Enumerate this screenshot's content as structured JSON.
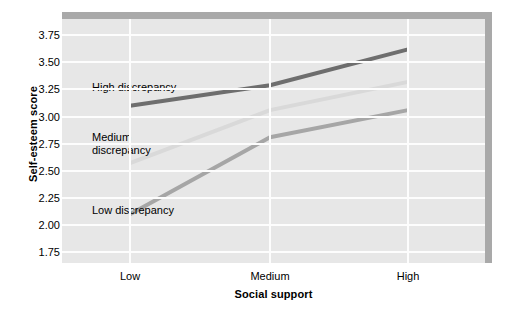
{
  "chart_data": {
    "type": "line",
    "title": "",
    "xlabel": "Social support",
    "ylabel": "Self-esteem score",
    "categories": [
      "Low",
      "Medium",
      "High"
    ],
    "ylim": [
      1.65,
      3.9
    ],
    "yticks": [
      3.75,
      3.5,
      3.25,
      3.0,
      2.75,
      2.5,
      2.25,
      2.0,
      1.75
    ],
    "ytick_labels": [
      "3.75",
      "3.50",
      "3.25",
      "3.00",
      "2.75",
      "2.50",
      "2.25",
      "2.00",
      "1.75"
    ],
    "grid": "horizontal-and-vertical",
    "legend_position": "inline-annotations",
    "series": [
      {
        "name": "High discrepancy",
        "values": [
          3.1,
          3.29,
          3.62
        ],
        "color": "#6e6e6e"
      },
      {
        "name": "Medium discrepancy",
        "values": [
          2.57,
          3.06,
          3.32
        ],
        "color": "#d9d9d9"
      },
      {
        "name": "Low discrepancy",
        "values": [
          2.1,
          2.81,
          3.06
        ],
        "color": "#a6a6a6"
      }
    ],
    "annotations": [
      {
        "text": "High discrepancy",
        "series": "High discrepancy"
      },
      {
        "text": "Medium\ndiscrepancy",
        "series": "Medium discrepancy"
      },
      {
        "text": "Low discrepancy",
        "series": "Low discrepancy"
      }
    ],
    "plot_background": "#e7e7e7",
    "gridline_color": "#fdfdfd",
    "shadow_color": "#a9a9a9"
  },
  "axes": {
    "y": {
      "title": "Self-esteem score",
      "ticks": [
        {
          "label": "3.75",
          "value": 3.75
        },
        {
          "label": "3.50",
          "value": 3.5
        },
        {
          "label": "3.25",
          "value": 3.25
        },
        {
          "label": "3.00",
          "value": 3.0
        },
        {
          "label": "2.75",
          "value": 2.75
        },
        {
          "label": "2.50",
          "value": 2.5
        },
        {
          "label": "2.25",
          "value": 2.25
        },
        {
          "label": "2.00",
          "value": 2.0
        },
        {
          "label": "1.75",
          "value": 1.75
        }
      ]
    },
    "x": {
      "title": "Social support",
      "ticks": [
        {
          "label": "Low"
        },
        {
          "label": "Medium"
        },
        {
          "label": "High"
        }
      ]
    }
  },
  "labels": {
    "high": "High discrepancy",
    "medium_line1": "Medium",
    "medium_line2": "discrepancy",
    "low": "Low discrepancy"
  }
}
